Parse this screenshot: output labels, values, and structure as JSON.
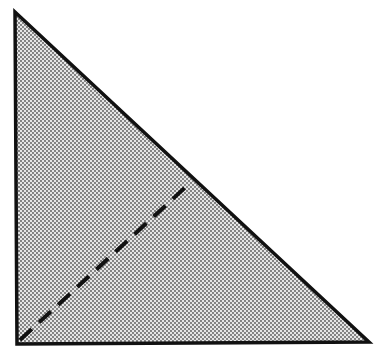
{
  "diagram": {
    "type": "right-triangle",
    "fill_pattern": "stippled-dots",
    "colors": {
      "stroke": "#111111",
      "fill_background": "#e6e6e6",
      "fill_dots": "#555555",
      "page": "#ffffff"
    },
    "vertices": {
      "top": [
        15,
        12
      ],
      "bottom_left": [
        17,
        344
      ],
      "bottom_right": [
        369,
        342
      ]
    },
    "dashed_segment": {
      "from": [
        20,
        340
      ],
      "to": [
        190,
        183
      ],
      "style": "dashed"
    }
  }
}
